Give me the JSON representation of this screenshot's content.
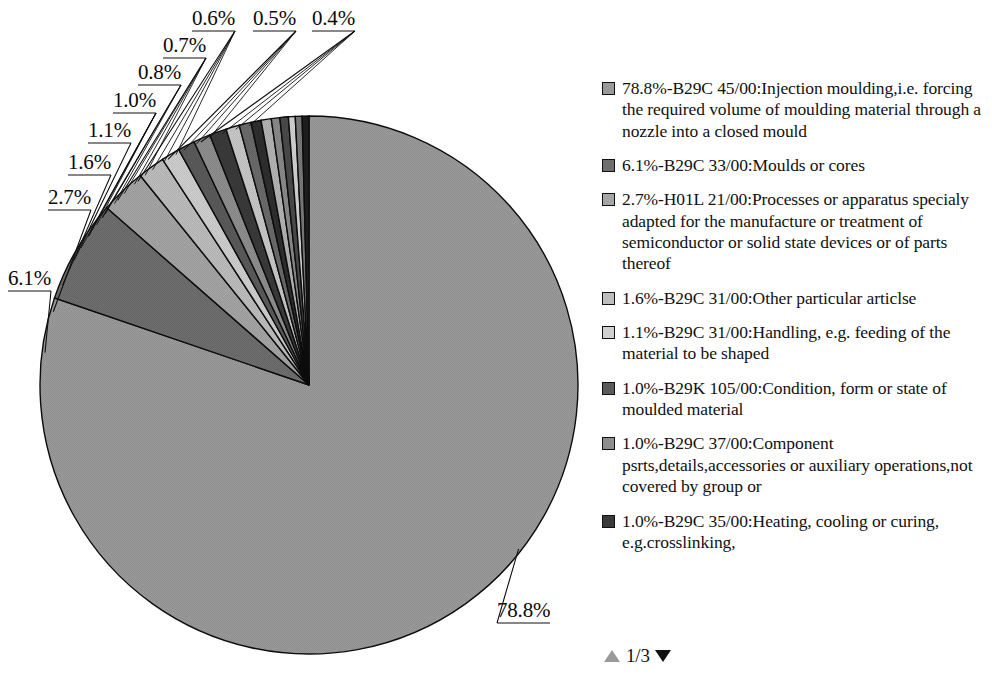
{
  "chart_data": {
    "type": "pie",
    "title": "",
    "unit": "%",
    "legend_position": "right",
    "categories": [
      "B29C 45/00:Injection moulding,i.e. forcing the required volume of moulding material through a nozzle into a closed mould",
      "B29C 33/00:Moulds or cores",
      "H01L 21/00:Processes or apparatus specialy adapted for the manufacture or treatment of semiconductor or solid state devices or of parts thereof",
      "B29C 31/00:Other particular articlse",
      "B29C 31/00:Handling, e.g. feeding of the material to be shaped",
      "B29K 105/00:Condition, form or state of moulded material",
      "B29C 37/00:Component psrts,details,accessories or auxiliary operations,not covered by group or",
      "B29C 35/00:Heating, cooling or curing, e.g.crosslinking,",
      "slice-9",
      "slice-10",
      "slice-11",
      "slice-12",
      "slice-13",
      "slice-14",
      "slice-15",
      "slice-16",
      "slice-17"
    ],
    "values": [
      78.8,
      6.1,
      2.7,
      1.6,
      1.1,
      1.0,
      1.0,
      1.0,
      0.8,
      0.7,
      0.6,
      0.6,
      0.5,
      0.5,
      0.4,
      0.4,
      0.4
    ],
    "slice_colors": [
      "#9a9a9a",
      "#6e6e6e",
      "#a5a5a5",
      "#bdbdbd",
      "#cfcfcf",
      "#5a5a5a",
      "#8e8e8e",
      "#3a3a3a",
      "#c8c8c8",
      "#6a6a6a",
      "#2e2e2e",
      "#b4b4b4",
      "#8a8a8a",
      "#4a4a4a",
      "#d2d2d2",
      "#7a7a7a",
      "#1f1f1f"
    ],
    "callout_labels": [
      {
        "text": "78.8%",
        "x": 497,
        "y": 600
      },
      {
        "text": "6.1%",
        "x": 8,
        "y": 268
      },
      {
        "text": "2.7%",
        "x": 48,
        "y": 187
      },
      {
        "text": "1.6%",
        "x": 68,
        "y": 152
      },
      {
        "text": "1.1%",
        "x": 88,
        "y": 120
      },
      {
        "text": "1.0%",
        "x": 113,
        "y": 90
      },
      {
        "text": "0.8%",
        "x": 138,
        "y": 62
      },
      {
        "text": "0.7%",
        "x": 163,
        "y": 35
      },
      {
        "text": "0.6%",
        "x": 192,
        "y": 8
      },
      {
        "text": "0.5%",
        "x": 253,
        "y": 8
      },
      {
        "text": "0.4%",
        "x": 312,
        "y": 8
      }
    ]
  },
  "legend": {
    "items": [
      {
        "color": "#9a9a9a",
        "text": "78.8%-B29C 45/00:Injection moulding,i.e. forcing the required volume of moulding material through a nozzle into a closed mould"
      },
      {
        "color": "#6e6e6e",
        "text": "6.1%-B29C 33/00:Moulds or cores"
      },
      {
        "color": "#a5a5a5",
        "text": "2.7%-H01L 21/00:Processes or apparatus specialy adapted for the manufacture or treatment of semiconductor or solid state devices or of parts thereof"
      },
      {
        "color": "#bdbdbd",
        "text": "1.6%-B29C 31/00:Other particular articlse"
      },
      {
        "color": "#cfcfcf",
        "text": "1.1%-B29C 31/00:Handling, e.g. feeding of the material to be shaped"
      },
      {
        "color": "#5a5a5a",
        "text": "1.0%-B29K 105/00:Condition, form or state of moulded material"
      },
      {
        "color": "#8e8e8e",
        "text": "1.0%-B29C 37/00:Component psrts,details,accessories or auxiliary operations,not covered by group or"
      },
      {
        "color": "#3a3a3a",
        "text": "1.0%-B29C 35/00:Heating, cooling or curing, e.g.crosslinking,"
      }
    ]
  },
  "pager": {
    "up_icon": "triangle-up-icon",
    "down_icon": "triangle-down-icon",
    "count": "1/3"
  }
}
